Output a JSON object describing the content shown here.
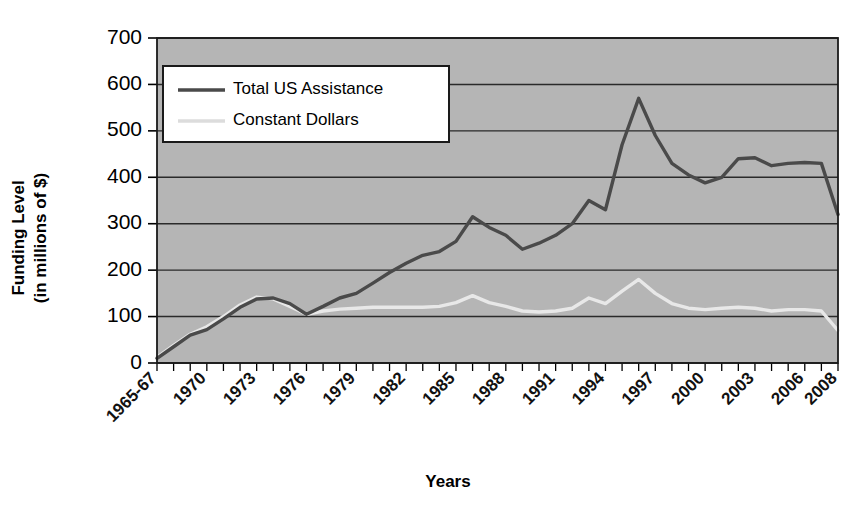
{
  "chart_data": {
    "type": "line",
    "title": "",
    "xlabel": "Years",
    "ylabel": "Funding Level (in millions of $)",
    "ylabel_line1": "Funding Level",
    "ylabel_line2": "(in millions of $)",
    "ylim": [
      0,
      700
    ],
    "ytick_labels": [
      "0",
      "100",
      "200",
      "300",
      "400",
      "500",
      "600",
      "700"
    ],
    "ytick_values": [
      0,
      100,
      200,
      300,
      400,
      500,
      600,
      700
    ],
    "grid": true,
    "legend_position": "top-left-inside",
    "plot_background": "#b5b5b5",
    "x": [
      "1965-67",
      "1968",
      "1969",
      "1970",
      "1971",
      "1972",
      "1973",
      "1974",
      "1975",
      "1976",
      "1977",
      "1978",
      "1979",
      "1980",
      "1981",
      "1982",
      "1983",
      "1984",
      "1985",
      "1986",
      "1987",
      "1988",
      "1989",
      "1990",
      "1991",
      "1992",
      "1993",
      "1994",
      "1995",
      "1996",
      "1997",
      "1998",
      "1999",
      "2000",
      "2001",
      "2002",
      "2003",
      "2004",
      "2005",
      "2006",
      "2007",
      "2008"
    ],
    "xtick_labels": [
      "1965-67",
      "1970",
      "1973",
      "1976",
      "1979",
      "1982",
      "1985",
      "1988",
      "1991",
      "1994",
      "1997",
      "2000",
      "2003",
      "2006",
      "2008"
    ],
    "xtick_label_indices": [
      0,
      3,
      6,
      9,
      12,
      15,
      18,
      21,
      24,
      27,
      30,
      33,
      36,
      39,
      41
    ],
    "series": [
      {
        "name": "Total US Assistance",
        "color": "#4a4a4a",
        "values": [
          10,
          35,
          60,
          72,
          95,
          120,
          138,
          140,
          128,
          105,
          122,
          140,
          150,
          172,
          195,
          215,
          232,
          240,
          262,
          315,
          292,
          275,
          245,
          258,
          275,
          300,
          350,
          330,
          470,
          570,
          490,
          430,
          405,
          388,
          400,
          440,
          442,
          425,
          430,
          432,
          430,
          320
        ]
      },
      {
        "name": "Constant Dollars",
        "color": "#e8e8e8",
        "values": [
          12,
          38,
          62,
          78,
          100,
          125,
          142,
          138,
          122,
          105,
          112,
          116,
          118,
          120,
          120,
          120,
          120,
          122,
          130,
          145,
          130,
          122,
          112,
          110,
          112,
          118,
          140,
          128,
          155,
          180,
          150,
          128,
          118,
          115,
          118,
          120,
          118,
          112,
          115,
          115,
          112,
          70
        ]
      }
    ]
  },
  "legend": {
    "entries": [
      {
        "label": "Total US Assistance",
        "color": "#4a4a4a"
      },
      {
        "label": "Constant Dollars",
        "color": "#dcdcdc"
      }
    ]
  }
}
